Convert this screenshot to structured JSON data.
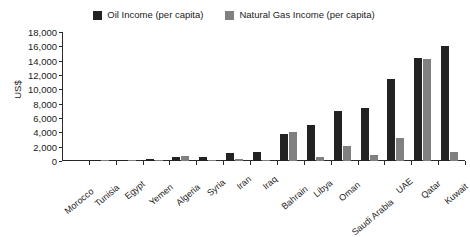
{
  "chart_data": {
    "type": "bar",
    "title": "",
    "subtitle": "",
    "xlabel": "",
    "ylabel": "US$",
    "ylim": [
      0,
      18000
    ],
    "ytick_labels": [
      "18,000",
      "16,000",
      "14,000",
      "12,000",
      "10,000",
      "8,000",
      "6,000",
      "4,000",
      "2,000",
      "0"
    ],
    "ytick_values": [
      18000,
      16000,
      14000,
      12000,
      10000,
      8000,
      6000,
      4000,
      2000,
      0
    ],
    "grid": false,
    "legend_position": "top-center",
    "categories": [
      "Morocco",
      "Tunisia",
      "Egypt",
      "Yemen",
      "Algeria",
      "Syria",
      "Iran",
      "Iraq",
      "Bahrain",
      "Libya",
      "Oman",
      "Saudi Arabia",
      "UAE",
      "Qatar",
      "Kuwait"
    ],
    "series": [
      {
        "name": "Oil Income (per capita)",
        "color": "#222222",
        "values": [
          20,
          80,
          200,
          350,
          500,
          600,
          1050,
          1200,
          3770,
          5000,
          7000,
          7350,
          11400,
          14350,
          16050
        ]
      },
      {
        "name": "Natural Gas Income (per capita)",
        "color": "#808080",
        "values": [
          0,
          40,
          110,
          30,
          700,
          40,
          350,
          30,
          4050,
          500,
          2100,
          900,
          3250,
          14250,
          1250
        ]
      }
    ]
  },
  "legend": {
    "entries": [
      {
        "label": "Oil Income (per capita)",
        "color": "#222222"
      },
      {
        "label": "Natural Gas Income (per capita)",
        "color": "#808080"
      }
    ]
  },
  "axes": {
    "y_title": "US$"
  }
}
